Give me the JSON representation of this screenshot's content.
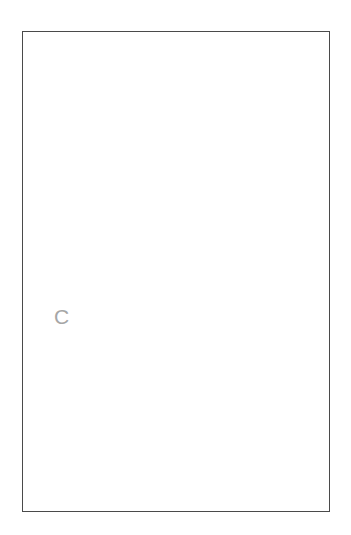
{
  "figure": {
    "panel_letter": "C",
    "caption_text": "",
    "frame": {
      "x": 22,
      "y": 31,
      "width": 308,
      "height": 481,
      "border_color": "#4a4a4a",
      "background": "#ffffff"
    },
    "colors": {
      "leaf_fill": "#a8a8a8",
      "leaf_outline": "#1a1a1a",
      "network_line": "#111111",
      "node_fill": "#0d0d0d",
      "twig_stroke": "#c9c9c9",
      "panel_letter": "#a6a6a6",
      "frame_border": "#4a4a4a",
      "page_background": "#ffffff"
    },
    "elements": {
      "twig_label": "twig-branch-silhouette",
      "leaf_label": "leaf-silhouette",
      "network_label": "vein-tracking-network"
    }
  },
  "chart_data": {
    "type": "scatter",
    "title": "",
    "subtitle": "",
    "xlabel": "",
    "ylabel": "",
    "grid": false,
    "legend_position": "none",
    "annotations": [
      {
        "text": "C",
        "x": 60,
        "y": 320
      }
    ],
    "shapes": {
      "twig_branch": {
        "name": "twig-branch-silhouette",
        "stroke": "#c9c9c9",
        "stroke_width": 2.2,
        "paths": [
          "M 68 270 C 76 250 88 230 101 213 C 118 191 140 168 163 148 C 190 125 218 106 246 90 C 265 79 282 70 299 62",
          "M 101 213 C 96 200 91 185 88 170 C 85 158 83 146 84 137",
          "M 113 200 C 116 214 120 227 124 238 C 128 249 131 258 131 264",
          "M 119 194 C 136 191 155 189 172 187 C 186 186 198 185 207 185",
          "M 140 172 C 159 164 177 156 190 149 C 199 144 206 140 211 137",
          "M 141 171 C 136 156 131 139 128 124 C 126 113 125 103 125 96",
          "M 165 146 C 162 130 159 112 158 97 C 157 86 157 77 158 71",
          "M 188 128 C 200 123 213 118 224 114 C 235 110 244 107 250 105",
          "M 212 111 C 208 98 205 85 203 74 C 202 65 201 57 201 51",
          "M 217 106 C 229 102 241 99 251 96 C 259 94 266 93 271 92"
        ]
      },
      "leaf_outline": {
        "name": "leaf-silhouette",
        "fill": "#a8a8a8",
        "stroke": "#1a1a1a",
        "stroke_width": 1.6,
        "path": "M 292 262 C 265 262 232 270 202 281 C 183 288 167 294 155 298 L 107 292 C 94 296 82 301 72 306 L 58 314 L 56 470 L 59 479 C 84 479 120 470 152 457 C 186 443 216 424 241 402 C 266 380 283 355 291 330 C 297 311 298 290 295 272 Z"
      },
      "network": {
        "name": "vein-tracking-network",
        "stroke": "#111111",
        "stroke_width": 1.7,
        "node_size": 7,
        "paths": [
          "M 292 262 C 265 283 240 302 219 317 C 201 330 186 340 175 347",
          "M 292 262 C 268 285 245 305 226 320 C 208 334 193 344 182 351",
          "M 175 347 C 166 352 156 357 147 362 C 135 369 123 378 113 387",
          "M 182 351 C 172 357 161 363 152 369 C 139 377 127 386 117 395",
          "M 113 387 C 105 394 97 402 91 410 C 84 419 78 428 74 436",
          "M 117 395 C 109 402 101 410 95 418 C 88 427 82 436 78 444",
          "M 74 436 C 71 442 69 448 68 453 C 67 459 67 464 68 468",
          "M 78 444 C 75 450 73 455 72 460 C 71 464 71 467 72 469",
          "M 219 317 C 222 303 225 289 227 279 C 228 272 229 267 229 262",
          "M 226 320 C 228 305 231 291 233 281 C 234 274 235 269 235 264",
          "M 219 317 C 230 314 243 311 254 309 C 265 307 274 306 281 305",
          "M 219 317 C 207 314 196 312 188 311 C 181 310 176 310 172 311",
          "M 172 311 C 168 304 164 297 161 291 C 158 285 156 280 155 276",
          "M 175 347 C 174 336 173 324 172 314 C 171 307 171 300 171 295",
          "M 175 347 C 189 348 204 349 217 350 C 228 351 237 352 243 353",
          "M 243 353 C 252 349 262 345 270 342 C 277 340 283 338 287 337",
          "M 243 353 C 251 351 260 349 267 348 C 273 347 278 347 281 347",
          "M 147 362 C 141 353 135 344 131 337 C 127 330 124 325 122 321",
          "M 122 321 C 120 311 119 301 118 293 C 117 286 117 280 117 276",
          "M 113 387 C 123 388 134 389 144 390 C 153 391 160 392 165 393",
          "M 165 393 C 174 389 184 385 192 382 C 199 380 205 379 209 378",
          "M 91 410 C 88 403 85 396 83 390 C 81 385 80 381 79 378",
          "M 74 436 C 85 437 97 438 108 439 C 118 440 126 441 132 442",
          "M 132 442 C 139 440 147 438 154 437 C 160 436 165 435 169 435",
          "M 155 298 C 152 307 149 317 147 325 C 145 332 144 338 144 343",
          "M 144 343 C 142 352 141 361 140 369 C 139 376 139 382 139 386"
        ],
        "nodes": [
          {
            "x": 292,
            "y": 262,
            "size": 9
          },
          {
            "x": 229,
            "y": 262,
            "size": 8
          },
          {
            "x": 235,
            "y": 264,
            "size": 8
          },
          {
            "x": 281,
            "y": 305,
            "size": 6
          },
          {
            "x": 219,
            "y": 317,
            "size": 9
          },
          {
            "x": 226,
            "y": 320,
            "size": 8
          },
          {
            "x": 172,
            "y": 311,
            "size": 7
          },
          {
            "x": 155,
            "y": 298,
            "size": 8
          },
          {
            "x": 175,
            "y": 347,
            "size": 9
          },
          {
            "x": 182,
            "y": 351,
            "size": 8
          },
          {
            "x": 243,
            "y": 353,
            "size": 6
          },
          {
            "x": 287,
            "y": 337,
            "size": 7
          },
          {
            "x": 281,
            "y": 347,
            "size": 7
          },
          {
            "x": 117,
            "y": 276,
            "size": 8
          },
          {
            "x": 122,
            "y": 321,
            "size": 6
          },
          {
            "x": 144,
            "y": 343,
            "size": 7
          },
          {
            "x": 139,
            "y": 386,
            "size": 8
          },
          {
            "x": 113,
            "y": 387,
            "size": 7
          },
          {
            "x": 165,
            "y": 393,
            "size": 6
          },
          {
            "x": 209,
            "y": 378,
            "size": 7
          },
          {
            "x": 79,
            "y": 378,
            "size": 7
          },
          {
            "x": 83,
            "y": 390,
            "size": 7
          },
          {
            "x": 74,
            "y": 436,
            "size": 8
          },
          {
            "x": 132,
            "y": 442,
            "size": 6
          },
          {
            "x": 143,
            "y": 440,
            "size": 6
          },
          {
            "x": 155,
            "y": 437,
            "size": 8
          },
          {
            "x": 68,
            "y": 468,
            "size": 9
          },
          {
            "x": 91,
            "y": 410,
            "size": 7
          }
        ]
      }
    }
  }
}
